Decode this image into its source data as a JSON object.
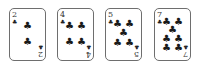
{
  "cards": [
    {
      "rank": "2",
      "suit": "clubs",
      "symbol": "♣",
      "left": 9,
      "pips": [
        [
          50,
          33
        ],
        [
          50,
          65
        ]
      ]
    },
    {
      "rank": "4",
      "suit": "clubs",
      "symbol": "♣",
      "left": 57,
      "pips": [
        [
          33,
          33
        ],
        [
          67,
          33
        ],
        [
          33,
          65
        ],
        [
          67,
          65
        ]
      ]
    },
    {
      "rank": "5",
      "suit": "clubs",
      "symbol": "♣",
      "left": 105,
      "pips": [
        [
          33,
          30
        ],
        [
          67,
          30
        ],
        [
          50,
          48
        ],
        [
          33,
          66
        ],
        [
          67,
          66
        ]
      ]
    },
    {
      "rank": "7",
      "suit": "clubs",
      "symbol": "♣",
      "left": 154,
      "pips": [
        [
          33,
          26
        ],
        [
          67,
          26
        ],
        [
          50,
          42
        ],
        [
          33,
          58
        ],
        [
          67,
          58
        ],
        [
          33,
          76
        ],
        [
          67,
          76
        ]
      ]
    }
  ]
}
